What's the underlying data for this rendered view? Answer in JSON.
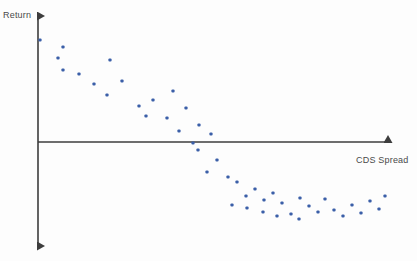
{
  "chart_data": {
    "type": "scatter",
    "title": "",
    "xlabel": "CDS Spread",
    "ylabel": "Return",
    "grid": false,
    "legend": null,
    "axis_style": "arrow-axes",
    "xlim": [
      0,
      100
    ],
    "ylim": [
      -100,
      100
    ],
    "x_axis_zero_y_px": 142,
    "y_axis_zero_x_px": 38,
    "point_color": "#3b5fa8",
    "point_count": 46,
    "points_px": [
      [
        40,
        40
      ],
      [
        63,
        47
      ],
      [
        58,
        58
      ],
      [
        63,
        70
      ],
      [
        79,
        74
      ],
      [
        110,
        60
      ],
      [
        94,
        84
      ],
      [
        107,
        95
      ],
      [
        122,
        81
      ],
      [
        139,
        106
      ],
      [
        153,
        100
      ],
      [
        146,
        116
      ],
      [
        167,
        118
      ],
      [
        173,
        91
      ],
      [
        186,
        108
      ],
      [
        179,
        131
      ],
      [
        199,
        125
      ],
      [
        193,
        143
      ],
      [
        211,
        134
      ],
      [
        198,
        150
      ],
      [
        217,
        160
      ],
      [
        207,
        172
      ],
      [
        228,
        177
      ],
      [
        237,
        182
      ],
      [
        246,
        196
      ],
      [
        255,
        189
      ],
      [
        264,
        200
      ],
      [
        273,
        193
      ],
      [
        282,
        203
      ],
      [
        263,
        212
      ],
      [
        291,
        214
      ],
      [
        300,
        198
      ],
      [
        309,
        206
      ],
      [
        318,
        212
      ],
      [
        277,
        216
      ],
      [
        299,
        219
      ],
      [
        325,
        199
      ],
      [
        334,
        210
      ],
      [
        343,
        216
      ],
      [
        352,
        205
      ],
      [
        361,
        213
      ],
      [
        370,
        201
      ],
      [
        379,
        209
      ],
      [
        385,
        196
      ],
      [
        247,
        208
      ],
      [
        232,
        205
      ]
    ],
    "points": [
      {
        "x": 1,
        "y": 78
      },
      {
        "x": 7,
        "y": 71
      },
      {
        "x": 6,
        "y": 60
      },
      {
        "x": 7,
        "y": 48
      },
      {
        "x": 12,
        "y": 44
      },
      {
        "x": 20,
        "y": 58
      },
      {
        "x": 16,
        "y": 34
      },
      {
        "x": 19,
        "y": 23
      },
      {
        "x": 24,
        "y": 37
      },
      {
        "x": 28,
        "y": 12
      },
      {
        "x": 33,
        "y": 18
      },
      {
        "x": 31,
        "y": 2
      },
      {
        "x": 36,
        "y": 0
      },
      {
        "x": 38,
        "y": 27
      },
      {
        "x": 42,
        "y": 10
      },
      {
        "x": 40,
        "y": -14
      },
      {
        "x": 46,
        "y": -8
      },
      {
        "x": 44,
        "y": -26
      },
      {
        "x": 49,
        "y": -17
      },
      {
        "x": 45,
        "y": -33
      },
      {
        "x": 50,
        "y": -43
      },
      {
        "x": 47,
        "y": -55
      },
      {
        "x": 53,
        "y": -60
      },
      {
        "x": 56,
        "y": -65
      },
      {
        "x": 58,
        "y": -79
      },
      {
        "x": 61,
        "y": -72
      },
      {
        "x": 63,
        "y": -83
      },
      {
        "x": 66,
        "y": -76
      },
      {
        "x": 69,
        "y": -86
      },
      {
        "x": 63,
        "y": -95
      },
      {
        "x": 71,
        "y": -97
      },
      {
        "x": 74,
        "y": -81
      },
      {
        "x": 76,
        "y": -89
      },
      {
        "x": 79,
        "y": -95
      },
      {
        "x": 67,
        "y": -99
      },
      {
        "x": 73,
        "y": -102
      },
      {
        "x": 81,
        "y": -82
      },
      {
        "x": 83,
        "y": -93
      },
      {
        "x": 86,
        "y": -99
      },
      {
        "x": 88,
        "y": -88
      },
      {
        "x": 91,
        "y": -96
      },
      {
        "x": 93,
        "y": -84
      },
      {
        "x": 96,
        "y": -92
      },
      {
        "x": 98,
        "y": -79
      },
      {
        "x": 57,
        "y": -91
      },
      {
        "x": 53,
        "y": -88
      }
    ]
  },
  "axes": {
    "x_label": "CDS Spread",
    "y_label": "Return",
    "line_color": "#3d3d3d"
  }
}
